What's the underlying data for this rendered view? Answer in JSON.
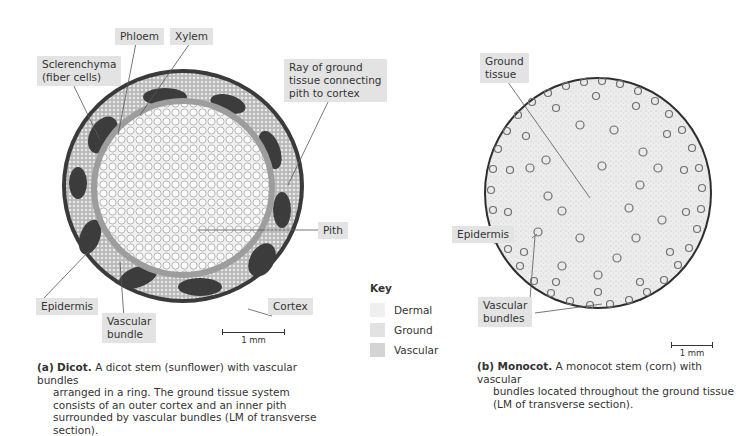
{
  "dicot": {
    "labels": {
      "sclerenchyma": "Sclerenchyma\n(fiber cells)",
      "sclerenchyma_line1": "Sclerenchyma",
      "sclerenchyma_line2": "(fiber cells)",
      "phloem": "Phloem",
      "xylem": "Xylem",
      "ray_line1": "Ray of ground",
      "ray_line2": "tissue connecting",
      "ray_line3": "pith to cortex",
      "pith": "Pith",
      "epidermis": "Epidermis",
      "vascular_line1": "Vascular",
      "vascular_line2": "bundle",
      "cortex": "Cortex"
    },
    "scale_label": "1 mm",
    "caption": {
      "prefix": "(a)",
      "bold": "Dicot.",
      "first_line": " A dicot stem (sunflower) with vascular bundles",
      "rest": "arranged in a ring. The ground tissue system consists of an outer cortex and an inner pith surrounded by vascular bundles (LM of transverse section)."
    }
  },
  "key": {
    "title": "Key",
    "items": [
      {
        "label": "Dermal",
        "color": "#efefef"
      },
      {
        "label": "Ground",
        "color": "#e2e2e2"
      },
      {
        "label": "Vascular",
        "color": "#d4d4d4"
      }
    ]
  },
  "monocot": {
    "labels": {
      "ground_line1": "Ground",
      "ground_line2": "tissue",
      "epidermis": "Epidermis",
      "vascular_line1": "Vascular",
      "vascular_line2": "bundles"
    },
    "scale_label": "1 mm",
    "caption": {
      "prefix": "(b)",
      "bold": "Monocot.",
      "first_line": " A monocot stem (corn) with vascular",
      "rest": "bundles located throughout the ground tissue (LM of transverse section)."
    }
  }
}
